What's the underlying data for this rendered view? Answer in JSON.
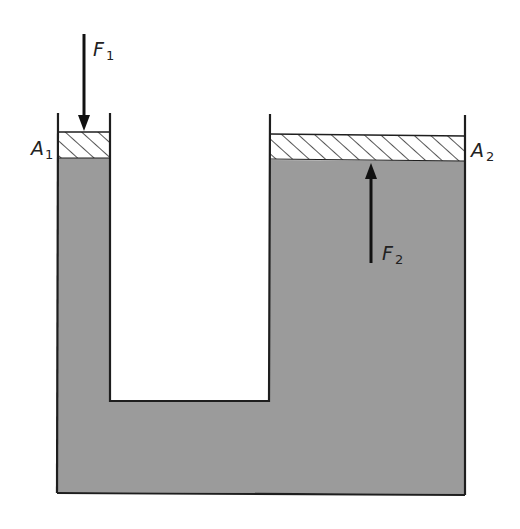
{
  "diagram": {
    "colors": {
      "fluid": "#9b9b9b",
      "outline": "#1e1e1e",
      "piston_fill": "#ffffff",
      "hatch": "#2a2a2a",
      "background": "#ffffff"
    },
    "labels": {
      "force_small": {
        "main": "F",
        "sub": "1"
      },
      "force_large": {
        "main": "F",
        "sub": "2"
      },
      "area_small": {
        "main": "A",
        "sub": "1"
      },
      "area_large": {
        "main": "A",
        "sub": "2"
      }
    },
    "components": [
      {
        "id": "small-piston",
        "label": "A1",
        "description": "hatched piston in narrow left column"
      },
      {
        "id": "large-piston",
        "label": "A2",
        "description": "hatched piston in wide right column"
      },
      {
        "id": "force-arrow-down",
        "label": "F1",
        "direction": "down"
      },
      {
        "id": "force-arrow-up",
        "label": "F2",
        "direction": "up"
      },
      {
        "id": "fluid",
        "description": "gray fluid filling U-shaped vessel"
      }
    ]
  }
}
